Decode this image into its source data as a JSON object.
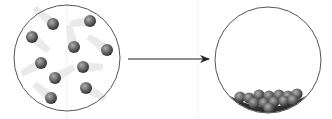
{
  "diagram": {
    "colors": {
      "container_stroke": "#555555",
      "particle_dark": "#3a3a3a",
      "particle_light": "#a8a8a8",
      "trail": "#e4e4e4",
      "arrow": "#222222",
      "guide_line": "#eeeeee"
    },
    "left_container": {
      "cx": 67,
      "cy": 58,
      "r": 53,
      "particles": [
        {
          "x": 53,
          "y": 24,
          "trail_dx": -14,
          "trail_dy": -12
        },
        {
          "x": 90,
          "y": 21,
          "trail_dx": -14,
          "trail_dy": 2
        },
        {
          "x": 32,
          "y": 37,
          "trail_dx": 12,
          "trail_dy": 10
        },
        {
          "x": 74,
          "y": 47,
          "trail_dx": -4,
          "trail_dy": -16
        },
        {
          "x": 107,
          "y": 50,
          "trail_dx": -14,
          "trail_dy": -10
        },
        {
          "x": 41,
          "y": 63,
          "trail_dx": -14,
          "trail_dy": 8
        },
        {
          "x": 83,
          "y": 67,
          "trail_dx": 14,
          "trail_dy": 0
        },
        {
          "x": 55,
          "y": 78,
          "trail_dx": 14,
          "trail_dy": -8
        },
        {
          "x": 86,
          "y": 88,
          "trail_dx": 14,
          "trail_dy": 8
        },
        {
          "x": 51,
          "y": 98,
          "trail_dx": -12,
          "trail_dy": -10
        }
      ]
    },
    "arrow": {
      "x1": 128,
      "y1": 59,
      "x2": 209,
      "y2": 59
    },
    "right_container": {
      "cx": 268,
      "cy": 60,
      "r": 53,
      "particles": [
        {
          "x": 240,
          "y": 97
        },
        {
          "x": 249,
          "y": 98
        },
        {
          "x": 259,
          "y": 95
        },
        {
          "x": 269,
          "y": 96
        },
        {
          "x": 279,
          "y": 95
        },
        {
          "x": 288,
          "y": 96
        },
        {
          "x": 297,
          "y": 94
        },
        {
          "x": 254,
          "y": 103
        },
        {
          "x": 264,
          "y": 103
        },
        {
          "x": 274,
          "y": 102
        },
        {
          "x": 284,
          "y": 101
        },
        {
          "x": 293,
          "y": 100
        },
        {
          "x": 269,
          "y": 108
        }
      ]
    }
  }
}
